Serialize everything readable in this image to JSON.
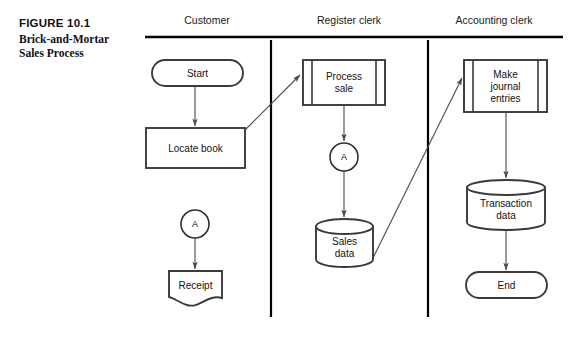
{
  "figure": {
    "number": "FIGURE 10.1",
    "title_line1": "Brick-and-Mortar",
    "title_line2": "Sales Process"
  },
  "lanes": [
    {
      "id": "customer",
      "label": "Customer",
      "label_x": 207,
      "label_y": 20
    },
    {
      "id": "register-clerk",
      "label": "Register clerk",
      "label_x": 349,
      "label_y": 20
    },
    {
      "id": "accounting-clerk",
      "label": "Accounting clerk",
      "label_x": 494,
      "label_y": 20
    }
  ],
  "lane_rule": {
    "x1": 145,
    "x2": 563,
    "y": 37
  },
  "lane_dividers": [
    {
      "x": 271,
      "y1": 40,
      "y2": 317
    },
    {
      "x": 428,
      "y1": 40,
      "y2": 317
    }
  ],
  "nodes": [
    {
      "id": "start",
      "type": "terminator",
      "label": "Start",
      "lane": "customer",
      "x": 152,
      "y": 60,
      "w": 91,
      "h": 26,
      "text_lines": [
        "Start"
      ]
    },
    {
      "id": "locate-book",
      "type": "process",
      "label": "Locate book",
      "lane": "customer",
      "x": 146,
      "y": 128,
      "w": 99,
      "h": 40,
      "text_lines": [
        "Locate book"
      ]
    },
    {
      "id": "connector-a-customer",
      "type": "connector",
      "label": "A",
      "lane": "customer",
      "cx": 195,
      "cy": 224,
      "r": 14,
      "text_lines": [
        "A"
      ]
    },
    {
      "id": "receipt",
      "type": "document",
      "label": "Receipt",
      "lane": "customer",
      "x": 169,
      "y": 271,
      "w": 53,
      "h": 35,
      "text_lines": [
        "Receipt"
      ]
    },
    {
      "id": "process-sale",
      "type": "predefined-process",
      "label": "Process sale",
      "lane": "register-clerk",
      "x": 303,
      "y": 60,
      "w": 82,
      "h": 45,
      "text_lines": [
        "Process",
        "sale"
      ]
    },
    {
      "id": "connector-a-register",
      "type": "connector",
      "label": "A",
      "lane": "register-clerk",
      "cx": 344,
      "cy": 157,
      "r": 14,
      "text_lines": [
        "A"
      ]
    },
    {
      "id": "sales-data",
      "type": "database",
      "label": "Sales data",
      "lane": "register-clerk",
      "x": 316,
      "y": 219,
      "w": 57,
      "h": 48,
      "text_lines": [
        "Sales",
        "data"
      ]
    },
    {
      "id": "make-journal-entries",
      "type": "predefined-process",
      "label": "Make journal entries",
      "lane": "accounting-clerk",
      "x": 464,
      "y": 60,
      "w": 83,
      "h": 52,
      "text_lines": [
        "Make",
        "journal",
        "entries"
      ]
    },
    {
      "id": "transaction-data",
      "type": "database",
      "label": "Transaction data",
      "lane": "accounting-clerk",
      "x": 467,
      "y": 180,
      "w": 78,
      "h": 50,
      "text_lines": [
        "Transaction",
        "data"
      ]
    },
    {
      "id": "end",
      "type": "terminator",
      "label": "End",
      "lane": "accounting-clerk",
      "x": 466,
      "y": 272,
      "w": 81,
      "h": 26,
      "text_lines": [
        "End"
      ]
    }
  ],
  "flows": [
    {
      "id": "start-to-locate-book",
      "from": "start",
      "to": "locate-book",
      "d": "M 195 86 L 195 126"
    },
    {
      "id": "locate-book-to-process-sale",
      "from": "locate-book",
      "to": "process-sale",
      "d": "M 245 130 L 300 75"
    },
    {
      "id": "process-sale-to-connector-a",
      "from": "process-sale",
      "to": "connector-a-register",
      "d": "M 344 105 L 344 141"
    },
    {
      "id": "connector-a-to-sales-data",
      "from": "connector-a-register",
      "to": "sales-data",
      "d": "M 344 171 L 344 217"
    },
    {
      "id": "sales-data-to-make-journal-entries",
      "from": "sales-data",
      "to": "make-journal-entries",
      "d": "M 373 258 L 462 78"
    },
    {
      "id": "connector-a-customer-to-receipt",
      "from": "connector-a-customer",
      "to": "receipt",
      "d": "M 195 238 L 195 269"
    },
    {
      "id": "make-journal-entries-to-transaction-data",
      "from": "make-journal-entries",
      "to": "transaction-data",
      "d": "M 506 112 L 506 178"
    },
    {
      "id": "transaction-data-to-end",
      "from": "transaction-data",
      "to": "end",
      "d": "M 506 230 L 506 270"
    }
  ]
}
